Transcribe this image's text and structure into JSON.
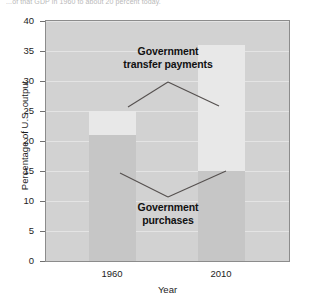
{
  "caption_fragment": "...of that GDP in 1960 to about 20 percent today.",
  "chart_data": {
    "type": "bar",
    "title": "",
    "subtitle": "",
    "xlabel": "Year",
    "ylabel": "Percentage of U.S. output",
    "categories": [
      "1960",
      "2010"
    ],
    "ylim": [
      0,
      40
    ],
    "yticks": [
      0,
      5,
      10,
      15,
      20,
      25,
      30,
      35,
      40
    ],
    "ytick_labels": [
      "0",
      "5",
      "10",
      "15",
      "20",
      "25",
      "30",
      "35",
      "40"
    ],
    "xtick_labels": [
      "1960",
      "2010"
    ],
    "grid": true,
    "stacked": true,
    "legend": "none",
    "series": [
      {
        "name": "Government purchases",
        "values": [
          21,
          15
        ],
        "color": "#c6c6c6"
      },
      {
        "name": "Government transfer payments",
        "values": [
          4,
          21
        ],
        "color": "#e8e8e8"
      }
    ],
    "stack_tops": [
      25,
      36
    ],
    "annotations": [
      {
        "label": "Government transfer payments",
        "line1": "Government",
        "line2": "transfer payments",
        "points": "1960 top segment, 2010 top segment"
      },
      {
        "label": "Government purchases",
        "line1": "Government",
        "line2": "purchases",
        "points": "1960 bottom segment, 2010 bottom segment"
      }
    ]
  },
  "plot": {
    "bg_color": "#d2d2d2",
    "border_color": "#8c8c8c",
    "gridline_color": "#e4e4e4"
  }
}
